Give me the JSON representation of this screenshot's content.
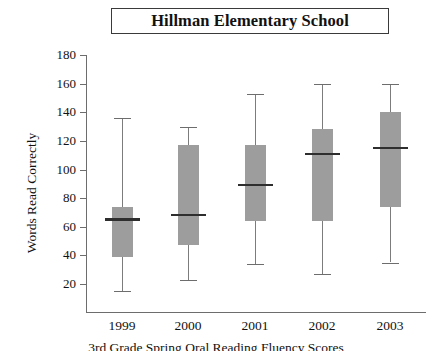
{
  "title": "Hillman Elementary School",
  "caption": "3rd Grade Spring Oral Reading Fluency Scores",
  "axes": {
    "ylabel": "Words Read Correctly",
    "xlabel": ""
  },
  "chart_data": {
    "type": "box",
    "title": "Hillman Elementary School",
    "xlabel": "",
    "ylabel": "Words Read Correctly",
    "ylim": [
      0,
      180
    ],
    "ytick_labels": [
      "180",
      "160",
      "140",
      "120",
      "100",
      "80",
      "60",
      "40",
      "20"
    ],
    "yticks": [
      180,
      160,
      140,
      120,
      100,
      80,
      60,
      40,
      20
    ],
    "ytick_step": 20,
    "grid": false,
    "legend": "none",
    "categories": [
      "1999",
      "2000",
      "2001",
      "2002",
      "2003"
    ],
    "boxes": [
      {
        "category": "1999",
        "whisker_low": 15,
        "q1": 39,
        "median": 65,
        "q3": 74,
        "whisker_high": 136
      },
      {
        "category": "2000",
        "whisker_low": 23,
        "q1": 47,
        "median": 68,
        "q3": 117,
        "whisker_high": 130
      },
      {
        "category": "2001",
        "whisker_low": 34,
        "q1": 64,
        "median": 89,
        "q3": 117,
        "whisker_high": 153
      },
      {
        "category": "2002",
        "whisker_low": 27,
        "q1": 64,
        "median": 111,
        "q3": 128,
        "whisker_high": 160
      },
      {
        "category": "2003",
        "whisker_low": 35,
        "q1": 74,
        "median": 115,
        "q3": 140,
        "whisker_high": 160
      }
    ]
  },
  "colors": {
    "box_fill": "#9d9d9d",
    "median": "#2e2e2e",
    "axis": "#6d6d6d",
    "text": "#111111",
    "background": "#ffffff"
  }
}
